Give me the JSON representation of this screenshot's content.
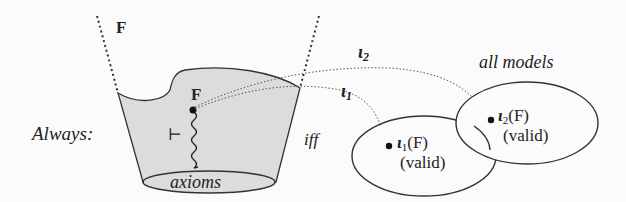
{
  "diagram": {
    "formula_top_label": "F",
    "formula_inner_label": "F",
    "always_label": "Always:",
    "turnstile_symbol": "⊢",
    "axioms_label": "axioms",
    "iff_label": "iff",
    "all_models_label": "all models",
    "interpretation_1": {
      "name": "ι",
      "sub": "1",
      "image_label": "(F)",
      "status": "(valid)"
    },
    "interpretation_2": {
      "name": "ι",
      "sub": "2",
      "image_label": "(F)",
      "status": "(valid)"
    },
    "colors": {
      "bucket_fill": "#dcdcdc",
      "ink": "#222222",
      "background": "#fbfbfb"
    }
  }
}
